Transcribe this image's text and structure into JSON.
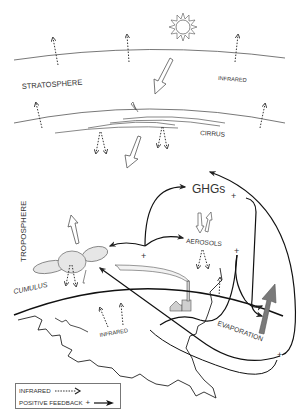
{
  "diagram": {
    "layers": {
      "stratosphere": "STRATOSPHERE",
      "troposphere": "TROPOSPHERE"
    },
    "labels": {
      "infrared_upper": "INFRARED",
      "cirrus": "CIRRUS",
      "ghgs": "GHGs",
      "ghgs_sign": "+",
      "aerosols": "AEROSOLS",
      "aerosols_sign": "+",
      "center_sign": "+",
      "cumulus": "CUMULUS",
      "infrared_lower": "INFRARED",
      "evaporation": "EVAPORATION",
      "evaporation_sign": "+"
    },
    "icons": [
      "sun-icon",
      "factory-icon",
      "cloud-icon"
    ],
    "legend": {
      "infrared_label": "INFRARED",
      "feedback_label": "POSITIVE FEEDBACK",
      "feedback_sign": "+"
    },
    "colors": {
      "line": "#222222",
      "text": "#333333",
      "cloud_fill": "#e6e6e6",
      "evaporation_arrow": "#7a7a7a"
    }
  }
}
